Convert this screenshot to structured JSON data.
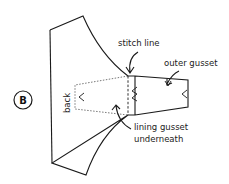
{
  "figure": {
    "badge": "B",
    "labels": {
      "back": "back",
      "stitch_line": "stitch line",
      "outer_gusset": "outer gusset",
      "lining_gusset_line1": "lining gusset",
      "lining_gusset_line2": "underneath"
    },
    "colors": {
      "stroke": "#1a1a1a",
      "background": "#ffffff"
    }
  }
}
